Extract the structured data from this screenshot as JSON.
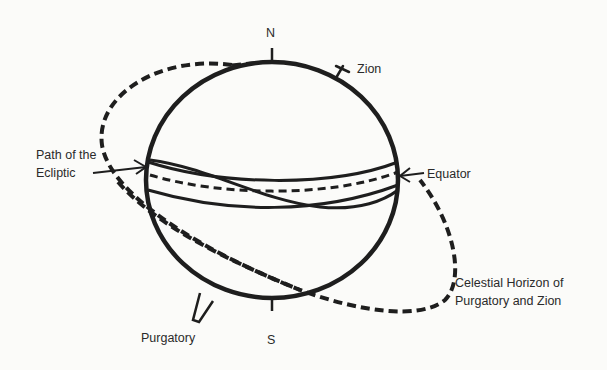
{
  "diagram": {
    "type": "celestial sphere",
    "labels": {
      "north": "N",
      "south": "S",
      "zion": "Zion",
      "ecliptic_line1": "Path of the",
      "ecliptic_line2": "Ecliptic",
      "equator": "Equator",
      "horizon_line1": "Celestial Horizon of",
      "horizon_line2": "Purgatory and Zion",
      "purgatory": "Purgatory"
    },
    "colors": {
      "ink": "#1e1e1e",
      "background": "#fbfbf9",
      "text": "#2a2a2a"
    }
  }
}
